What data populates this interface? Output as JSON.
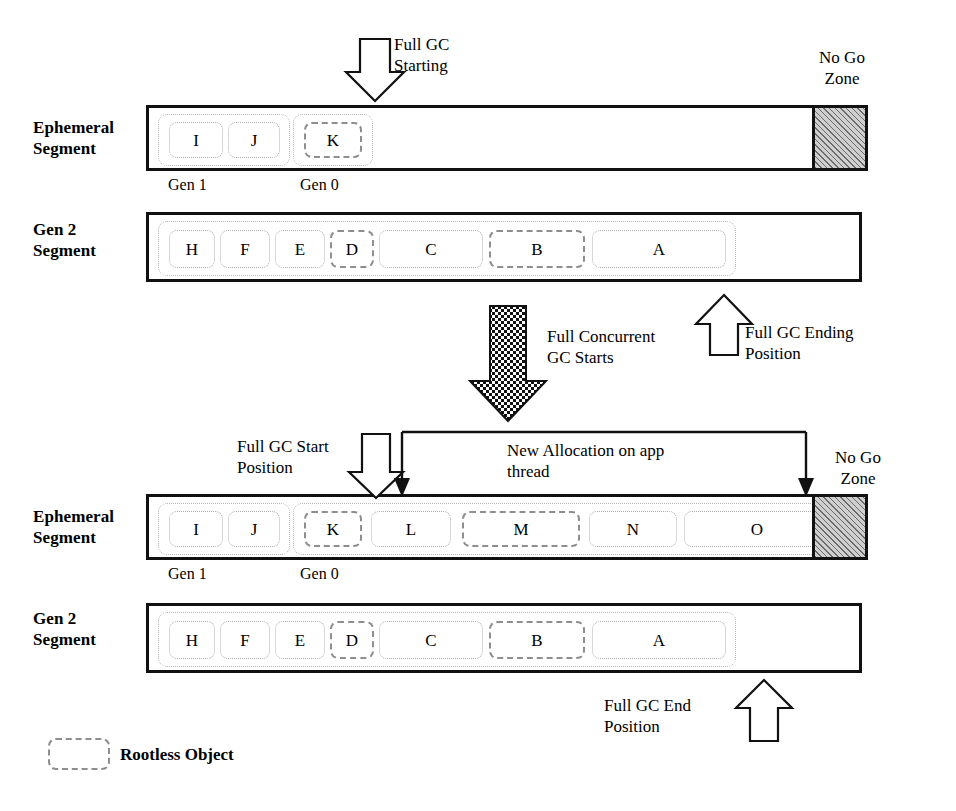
{
  "diagram": {
    "title_alt": "Background server GC / Full concurrent GC segment diagram",
    "legend": {
      "rootless_label": "Rootless Object",
      "swatch_icon": "dashed-rounded-rect-icon"
    },
    "phase_top": {
      "ephemeral": {
        "row_label": "Ephemeral\nSegment",
        "gen1_caption": "Gen 1",
        "gen0_caption": "Gen 0",
        "objects": [
          {
            "label": "I",
            "state": "rooted",
            "gen": "Gen 1"
          },
          {
            "label": "J",
            "state": "rooted",
            "gen": "Gen 1"
          },
          {
            "label": "K",
            "state": "rootless",
            "gen": "Gen 0"
          }
        ],
        "no_go_zone_label": "No Go\nZone"
      },
      "gen2": {
        "row_label": "Gen 2\nSegment",
        "objects": [
          {
            "label": "H",
            "state": "rooted"
          },
          {
            "label": "F",
            "state": "rooted"
          },
          {
            "label": "E",
            "state": "rooted"
          },
          {
            "label": "D",
            "state": "rootless"
          },
          {
            "label": "C",
            "state": "rooted"
          },
          {
            "label": "B",
            "state": "rootless"
          },
          {
            "label": "A",
            "state": "rooted"
          }
        ]
      },
      "annotations": {
        "full_gc_starting": "Full GC\nStarting",
        "full_gc_ending_position": "Full GC Ending\nPosition"
      }
    },
    "transition": {
      "label": "Full Concurrent\nGC Starts",
      "arrow_icon": "checkered-down-arrow-icon"
    },
    "phase_bottom": {
      "ephemeral": {
        "row_label": "Ephemeral\nSegment",
        "gen1_caption": "Gen 1",
        "gen0_caption": "Gen 0",
        "objects": [
          {
            "label": "I",
            "state": "rooted",
            "gen": "Gen 1"
          },
          {
            "label": "J",
            "state": "rooted",
            "gen": "Gen 1"
          },
          {
            "label": "K",
            "state": "rootless",
            "gen": "Gen 0"
          },
          {
            "label": "L",
            "state": "rooted",
            "gen": "Gen 0"
          },
          {
            "label": "M",
            "state": "rootless",
            "gen": "Gen 0"
          },
          {
            "label": "N",
            "state": "rooted",
            "gen": "Gen 0"
          },
          {
            "label": "O",
            "state": "rooted",
            "gen": "Gen 0"
          }
        ],
        "no_go_zone_label": "No Go\nZone"
      },
      "gen2": {
        "row_label": "Gen 2\nSegment",
        "objects": [
          {
            "label": "H",
            "state": "rooted"
          },
          {
            "label": "F",
            "state": "rooted"
          },
          {
            "label": "E",
            "state": "rooted"
          },
          {
            "label": "D",
            "state": "rootless"
          },
          {
            "label": "C",
            "state": "rooted"
          },
          {
            "label": "B",
            "state": "rootless"
          },
          {
            "label": "A",
            "state": "rooted"
          }
        ]
      },
      "annotations": {
        "full_gc_start_position": "Full GC Start\nPosition",
        "new_allocation": "New Allocation on app\nthread",
        "full_gc_end_position": "Full GC End\nPosition"
      }
    }
  },
  "colors": {
    "ink": "#111111",
    "rootless_border": "#8e8e8e",
    "rooted_border": "#adadad",
    "nogo_fill": "#cfcfcf"
  }
}
